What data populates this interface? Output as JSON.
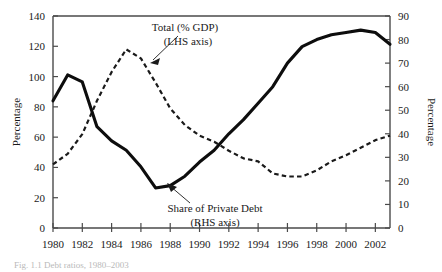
{
  "figure": {
    "caption": "Fig. 1.1   Debt ratios, 1980–2003"
  },
  "chart_data": {
    "type": "line",
    "title": "",
    "xlabel": "",
    "ylabel": "Percentage",
    "y2label": "Percentage",
    "xlim": [
      1980,
      2003
    ],
    "ylim": [
      0,
      140
    ],
    "y2lim": [
      0,
      90
    ],
    "grid": false,
    "legend": "annotations-with-arrows",
    "xticks": [
      1980,
      1982,
      1984,
      1986,
      1988,
      1990,
      1992,
      1994,
      1996,
      1998,
      2000,
      2002
    ],
    "xtick_labels": [
      "1980",
      "1982",
      "1984",
      "1986",
      "1988",
      "1990",
      "1992",
      "1994",
      "1996",
      "1998",
      "2000",
      "2002"
    ],
    "yticks": [
      0,
      20,
      40,
      60,
      80,
      100,
      120,
      140
    ],
    "ytick_labels": [
      "0",
      "20",
      "40",
      "60",
      "80",
      "100",
      "120",
      "140"
    ],
    "y2ticks": [
      0,
      10,
      20,
      30,
      40,
      50,
      60,
      70,
      80,
      90
    ],
    "y2tick_labels": [
      "0",
      "10",
      "20",
      "30",
      "40",
      "50",
      "60",
      "70",
      "80",
      "90"
    ],
    "x": [
      1980,
      1981,
      1982,
      1983,
      1984,
      1985,
      1986,
      1987,
      1988,
      1989,
      1990,
      1991,
      1992,
      1993,
      1994,
      1995,
      1996,
      1997,
      1998,
      1999,
      2000,
      2001,
      2002,
      2003
    ],
    "series": [
      {
        "name": "Total (% GDP)",
        "axis": "left",
        "style": "dashed",
        "label_line1": "Total (% GDP)",
        "label_line2": "(LHS axis)",
        "values": [
          42,
          49,
          62,
          84,
          103,
          118,
          112,
          96,
          79,
          68,
          61,
          57,
          51,
          46,
          44,
          36,
          34,
          34,
          38,
          44,
          48,
          53,
          58,
          61
        ]
      },
      {
        "name": "Share of Private Debt",
        "axis": "right",
        "style": "solid",
        "label_line1": "Share of Private Debt",
        "label_line2": "(RHS axis)",
        "values": [
          54,
          65,
          62,
          43,
          37,
          33,
          26,
          17,
          18,
          22,
          28,
          33,
          40,
          46,
          53,
          60,
          70,
          77,
          80,
          82,
          83,
          84,
          83,
          78
        ]
      }
    ],
    "annotations": [
      {
        "text_line1": "Total (% GDP)",
        "text_line2": "(LHS axis)",
        "points_to_series": "Total (% GDP)",
        "arrow_direction": "down-left"
      },
      {
        "text_line1": "Share of Private Debt",
        "text_line2": "(RHS axis)",
        "points_to_series": "Share of Private Debt",
        "arrow_direction": "up-left"
      }
    ]
  }
}
